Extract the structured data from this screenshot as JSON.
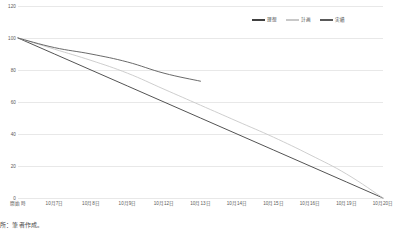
{
  "chart_data": {
    "type": "line",
    "title": "",
    "xlabel": "",
    "ylabel": "",
    "ylim": [
      0,
      120
    ],
    "yticks": [
      0,
      20,
      40,
      60,
      80,
      100,
      120
    ],
    "ytick_labels": [
      "0",
      "20",
      "40",
      "60",
      "80",
      "100",
      "120"
    ],
    "grid": true,
    "legend_position": "top-right",
    "categories": [
      "開始時",
      "10月7日",
      "10月8日",
      "10月9日",
      "10月12日",
      "10月13日",
      "10月14日",
      "10月15日",
      "10月16日",
      "10月19日",
      "10月20日"
    ],
    "series": [
      {
        "name": "理想",
        "color": "#404040",
        "values": [
          100,
          90,
          80,
          70,
          60,
          50,
          40,
          30,
          20,
          10,
          0
        ]
      },
      {
        "name": "計画",
        "color": "#c8c8c8",
        "values": [
          100,
          93,
          86,
          78,
          68,
          58,
          48,
          38,
          27,
          15,
          0
        ]
      },
      {
        "name": "実績",
        "color": "#595959",
        "values": [
          100,
          94,
          90,
          85,
          78,
          73,
          null,
          null,
          null,
          null,
          null
        ]
      }
    ]
  },
  "legend": {
    "entries": [
      {
        "label": "理想",
        "color": "#404040"
      },
      {
        "label": "計画",
        "color": "#c8c8c8"
      },
      {
        "label": "実績",
        "color": "#595959"
      }
    ]
  },
  "caption": {
    "source_text": "所：筆者作成。"
  }
}
